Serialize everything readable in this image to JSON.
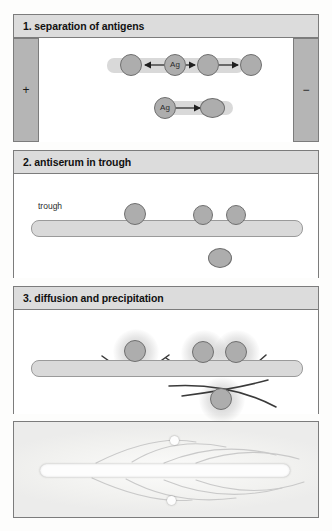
{
  "panels": [
    {
      "id": "panel1",
      "title": "1. separation of antigens",
      "electrodes": {
        "positive_label": "+",
        "negative_label": "−"
      },
      "lanes": [
        {
          "name": "upper-lane",
          "spots": [
            {
              "label": "",
              "cx": 24,
              "cy": 27,
              "r": 11
            },
            {
              "label": "Ag",
              "cx": 68,
              "cy": 27,
              "r": 11
            },
            {
              "label": "",
              "cx": 101,
              "cy": 27,
              "r": 11
            },
            {
              "label": "",
              "cx": 144,
              "cy": 27,
              "r": 11
            }
          ],
          "arrows": [
            {
              "from": 57,
              "to": 36,
              "y": 27,
              "direction": "left"
            },
            {
              "from": 79,
              "to": 89,
              "y": 27,
              "direction": "right"
            },
            {
              "from": 112,
              "to": 132,
              "y": 27,
              "direction": "right"
            }
          ]
        },
        {
          "name": "lower-lane",
          "spots": [
            {
              "label": "Ag",
              "cx": 23,
              "cy": 70,
              "r": 11
            },
            {
              "label": "",
              "cx": 68,
              "cy": 70,
              "r": 11
            }
          ],
          "arrows": [
            {
              "from": 34,
              "to": 56,
              "y": 70,
              "direction": "right"
            }
          ]
        }
      ]
    },
    {
      "id": "panel2",
      "title": "2. antiserum in trough",
      "trough_label": "trough",
      "spots": [
        {
          "cx": 121,
          "cy": 40,
          "r": 11
        },
        {
          "cx": 189,
          "cy": 41,
          "r": 10
        },
        {
          "cx": 222,
          "cy": 41,
          "r": 10
        },
        {
          "cx": 206,
          "cy": 85,
          "r": 11
        }
      ]
    },
    {
      "id": "panel3",
      "title": "3. diffusion and precipitation",
      "spots": [
        {
          "cx": 121,
          "cy": 41,
          "r": 11
        },
        {
          "cx": 189,
          "cy": 42,
          "r": 11
        },
        {
          "cx": 222,
          "cy": 42,
          "r": 11
        },
        {
          "cx": 207,
          "cy": 89,
          "r": 11
        }
      ],
      "precipitin_arcs": 5
    }
  ],
  "photo": {
    "caption": "",
    "wells": [
      {
        "cx": 160,
        "cy": 18
      },
      {
        "cx": 157,
        "cy": 78
      }
    ]
  },
  "colors": {
    "header_bg": "#dcdcdc",
    "panel_border": "#7c7c7c",
    "spot_fill": "#adadad",
    "spot_stroke": "#6f6f6f",
    "lane_fill": "#d9d9d9",
    "electrode_fill": "#b5b5b5",
    "arc_stroke": "#3a3a3a"
  }
}
